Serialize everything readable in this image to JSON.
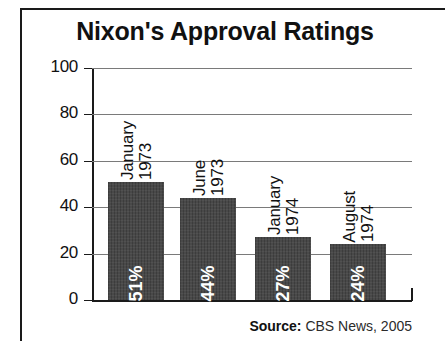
{
  "chart_data": {
    "type": "bar",
    "title": "Nixon's Approval Ratings",
    "categories": [
      "January 1973",
      "June 1973",
      "January 1974",
      "August 1974"
    ],
    "category_lines": [
      [
        "January",
        "1973"
      ],
      [
        "June",
        "1973"
      ],
      [
        "January",
        "1974"
      ],
      [
        "August",
        "1974"
      ]
    ],
    "values": [
      51,
      44,
      27,
      24
    ],
    "value_labels": [
      "51%",
      "44%",
      "27%",
      "24%"
    ],
    "xlabel": "",
    "ylabel": "",
    "ylim": [
      0,
      100
    ],
    "yticks": [
      0,
      20,
      40,
      60,
      80,
      100
    ],
    "ytick_labels": [
      "0",
      "20",
      "40",
      "60",
      "80",
      "100"
    ],
    "grid": true,
    "legend": false,
    "bar_color": "#434343",
    "value_label_color": "#ffffff",
    "axis_color": "#1a1a1a",
    "gridline_color": "#7a7a7a",
    "background_color": "#ffffff"
  },
  "source": {
    "label": "Source:",
    "text": "CBS News, 2005"
  }
}
